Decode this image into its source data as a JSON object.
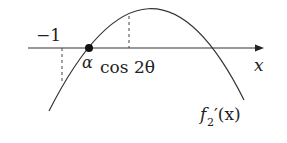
{
  "diagram": {
    "type": "function-graph",
    "axis_label": "x",
    "curve_label": "f",
    "curve_label_subscript": "2",
    "curve_label_suffix": "′(x)",
    "points": {
      "alpha": "α",
      "cos2theta": "cos 2θ",
      "minus_one": "−1"
    },
    "colors": {
      "line": "#333333",
      "text": "#222222",
      "background": "#ffffff"
    }
  }
}
